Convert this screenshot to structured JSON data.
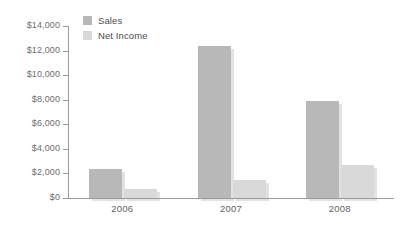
{
  "chart_data": {
    "type": "bar",
    "title": "",
    "subtitle": "",
    "xlabel": "",
    "ylabel": "",
    "categories": [
      "2006",
      "2007",
      "2008"
    ],
    "series": [
      {
        "name": "Sales",
        "values": [
          2400,
          12400,
          7900
        ],
        "color": "#b8b8b8"
      },
      {
        "name": "Net Income",
        "values": [
          700,
          1500,
          2700
        ],
        "color": "#d9d9d9"
      }
    ],
    "ylim": [
      0,
      14000
    ],
    "ytick_values": [
      0,
      2000,
      4000,
      6000,
      8000,
      10000,
      12000,
      14000
    ],
    "ytick_labels": [
      "$0",
      "$2,000",
      "$4,000",
      "$6,000",
      "$8,000",
      "$10,000",
      "$12,000",
      "$14,000"
    ],
    "grid": false,
    "legend_position": "top-left",
    "orientation": "vertical",
    "grouping": "grouped",
    "background_color": "#ffffff",
    "axis_color": "#9a9a9a",
    "shadow_color": "#e2e2e2"
  },
  "legend": {
    "items": [
      {
        "label": "Sales",
        "color": "#b8b8b8"
      },
      {
        "label": "Net Income",
        "color": "#d9d9d9"
      }
    ]
  }
}
